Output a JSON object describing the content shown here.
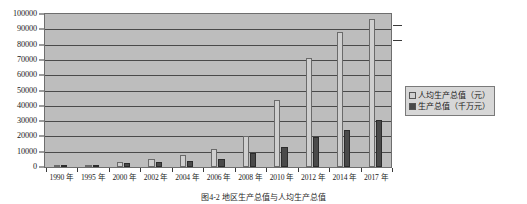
{
  "chart_data": {
    "type": "bar",
    "title": "",
    "xlabel": "",
    "ylabel": "",
    "ylim": [
      0,
      100000
    ],
    "yticks": [
      0,
      10000,
      20000,
      30000,
      40000,
      50000,
      60000,
      70000,
      80000,
      90000,
      100000
    ],
    "grid": true,
    "legend_position": "right",
    "categories": [
      "1990 年",
      "1995 年",
      "2000 年",
      "2002 年",
      "2004 年",
      "2006 年",
      "2008 年",
      "2010 年",
      "2012 年",
      "2014 年",
      "2017 年"
    ],
    "series": [
      {
        "name": "人均生产总值（元）",
        "color": "#cfcfcf",
        "values": [
          800,
          1600,
          3500,
          5000,
          7800,
          12000,
          20500,
          44000,
          71000,
          88000,
          96500
        ]
      },
      {
        "name": "生产总值（千万元）",
        "color": "#4a4a4a",
        "values": [
          400,
          1100,
          2600,
          3200,
          4000,
          5200,
          9200,
          13000,
          19500,
          24000,
          31000
        ]
      }
    ]
  },
  "axes": {
    "y_ticks": [
      "100000",
      "90000",
      "80000",
      "70000",
      "60000",
      "50000",
      "40000",
      "30000",
      "20000",
      "10000",
      "0"
    ],
    "x_ticks": [
      "1990 年",
      "1995 年",
      "2000 年",
      "2002 年",
      "2004 年",
      "2006 年",
      "2008 年",
      "2010 年",
      "2012 年",
      "2014 年",
      "2017 年"
    ]
  },
  "legend": {
    "items": [
      {
        "label": "人均生产总值（元）",
        "swatch": "light-gray"
      },
      {
        "label": "生产总值（千万元）",
        "swatch": "dark-gray"
      }
    ]
  },
  "caption": {
    "text": "图4-2 地区生产总值与人均生产总值"
  }
}
